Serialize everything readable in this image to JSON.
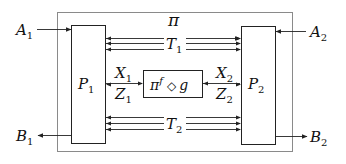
{
  "diagram": {
    "outer_label": "π",
    "parties": {
      "left": {
        "name": "P",
        "sub": "1",
        "input": {
          "name": "A",
          "sub": "1"
        },
        "output": {
          "name": "B",
          "sub": "1"
        }
      },
      "right": {
        "name": "P",
        "sub": "2",
        "input": {
          "name": "A",
          "sub": "2"
        },
        "output": {
          "name": "B",
          "sub": "2"
        }
      }
    },
    "channels": {
      "top": {
        "name": "T",
        "sub": "1",
        "line_count": 3
      },
      "bottom": {
        "name": "T",
        "sub": "2",
        "line_count": 3
      }
    },
    "center": {
      "label_pi": "π",
      "label_sup": "f",
      "label_op": "◇",
      "label_g": "g",
      "left_in": {
        "name": "X",
        "sub": "1"
      },
      "left_out": {
        "name": "Z",
        "sub": "1"
      },
      "right_in": {
        "name": "X",
        "sub": "2"
      },
      "right_out": {
        "name": "Z",
        "sub": "2"
      }
    },
    "colors": {
      "outer_border": "#8a8a8a",
      "box_border": "#222222",
      "arrow": "#222222",
      "text": "#111111"
    }
  }
}
